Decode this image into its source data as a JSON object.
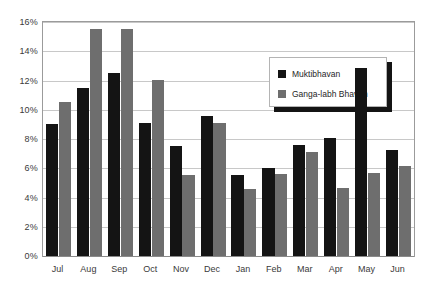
{
  "chart_data": {
    "type": "bar",
    "title": "",
    "xlabel": "",
    "ylabel": "",
    "ylim": [
      0,
      16
    ],
    "ytick_step": 2,
    "ytick_labels": [
      "0%",
      "2%",
      "4%",
      "6%",
      "8%",
      "10%",
      "12%",
      "14%",
      "16%"
    ],
    "ytick_values": [
      0,
      2,
      4,
      6,
      8,
      10,
      12,
      14,
      16
    ],
    "grid": true,
    "grid_axis": "y",
    "legend_position": "upper-right-inside",
    "categories": [
      "Jul",
      "Aug",
      "Sep",
      "Oct",
      "Nov",
      "Dec",
      "Jan",
      "Feb",
      "Mar",
      "Apr",
      "May",
      "Jun"
    ],
    "series": [
      {
        "name": "Muktibhavan",
        "color": "#141414",
        "values": [
          9.0,
          11.5,
          12.5,
          9.1,
          7.55,
          9.6,
          5.55,
          6.05,
          7.6,
          8.1,
          12.85,
          7.25
        ]
      },
      {
        "name": "Ganga-labh Bhavan",
        "color": "#6e6e6e",
        "values": [
          10.5,
          15.5,
          15.5,
          12.05,
          5.55,
          9.1,
          4.55,
          5.6,
          7.1,
          4.65,
          5.65,
          6.15
        ]
      }
    ]
  },
  "legend": {
    "entries": [
      {
        "label": "Muktibhavan"
      },
      {
        "label": "Ganga-labh Bhavan"
      }
    ]
  },
  "colors": {
    "series_0": "#141414",
    "series_1": "#6e6e6e",
    "gridline": "#c8c8c8",
    "frame": "#9b9b9b",
    "text": "#3a3a3a",
    "background": "#ffffff"
  }
}
